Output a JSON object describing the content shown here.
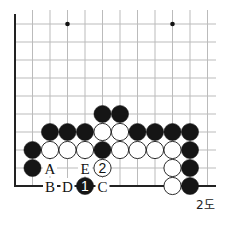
{
  "diagram": {
    "caption": "2도",
    "grid": {
      "x0": 15,
      "dx": 17.5,
      "cols": 12,
      "y0": 24,
      "dy": 18,
      "rows": 10,
      "right_extent": 216,
      "line_color": "#bbbbbb",
      "edge_color": "#222222"
    },
    "star_points": [
      {
        "col": 3,
        "row": 0
      },
      {
        "col": 9,
        "row": 0
      }
    ],
    "stones": [
      {
        "col": 5,
        "row": 5,
        "color": "black"
      },
      {
        "col": 6,
        "row": 5,
        "color": "black"
      },
      {
        "col": 2,
        "row": 6,
        "color": "black"
      },
      {
        "col": 3,
        "row": 6,
        "color": "black"
      },
      {
        "col": 4,
        "row": 6,
        "color": "black"
      },
      {
        "col": 5,
        "row": 6,
        "color": "white"
      },
      {
        "col": 6,
        "row": 6,
        "color": "white"
      },
      {
        "col": 7,
        "row": 6,
        "color": "black"
      },
      {
        "col": 8,
        "row": 6,
        "color": "black"
      },
      {
        "col": 9,
        "row": 6,
        "color": "black"
      },
      {
        "col": 10,
        "row": 6,
        "color": "black"
      },
      {
        "col": 1,
        "row": 7,
        "color": "black"
      },
      {
        "col": 2,
        "row": 7,
        "color": "white"
      },
      {
        "col": 3,
        "row": 7,
        "color": "white"
      },
      {
        "col": 4,
        "row": 7,
        "color": "white"
      },
      {
        "col": 5,
        "row": 7,
        "color": "black"
      },
      {
        "col": 6,
        "row": 7,
        "color": "white"
      },
      {
        "col": 7,
        "row": 7,
        "color": "white"
      },
      {
        "col": 8,
        "row": 7,
        "color": "white"
      },
      {
        "col": 9,
        "row": 7,
        "color": "white"
      },
      {
        "col": 10,
        "row": 7,
        "color": "black"
      },
      {
        "col": 1,
        "row": 8,
        "color": "black"
      },
      {
        "col": 5,
        "row": 8,
        "color": "white",
        "number": "2"
      },
      {
        "col": 9,
        "row": 8,
        "color": "white"
      },
      {
        "col": 10,
        "row": 8,
        "color": "black"
      },
      {
        "col": 4,
        "row": 9,
        "color": "black",
        "number": "1"
      },
      {
        "col": 9,
        "row": 9,
        "color": "white"
      },
      {
        "col": 10,
        "row": 9,
        "color": "black"
      }
    ],
    "letters": [
      {
        "col": 2,
        "row": 8,
        "text": "A"
      },
      {
        "col": 4,
        "row": 8,
        "text": "E"
      },
      {
        "col": 2,
        "row": 9,
        "text": "B"
      },
      {
        "col": 3,
        "row": 9,
        "text": "D"
      },
      {
        "col": 5,
        "row": 9,
        "text": "C"
      }
    ]
  }
}
